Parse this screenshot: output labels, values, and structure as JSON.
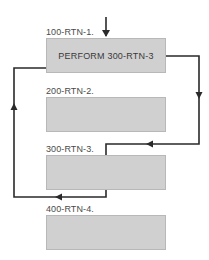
{
  "diagram": {
    "type": "flowchart",
    "colors": {
      "box_fill": "#d0d0d0",
      "box_border": "#b8b8b8",
      "arrow": "#2a2a2a",
      "label_text": "#4a4a4a"
    },
    "routines": [
      {
        "label": "100-RTN-1.",
        "content": "PERFORM 300-RTN-3"
      },
      {
        "label": "200-RTN-2.",
        "content": ""
      },
      {
        "label": "300-RTN-3.",
        "content": ""
      },
      {
        "label": "400-RTN-4.",
        "content": ""
      }
    ],
    "edges": [
      {
        "from": "entry",
        "to": "100-RTN-1."
      },
      {
        "from": "100-RTN-1.",
        "to": "300-RTN-3.",
        "note": "PERFORM jump"
      },
      {
        "from": "300-RTN-3.",
        "to": "100-RTN-1.",
        "note": "return after 300-RTN-3 ends"
      }
    ]
  }
}
